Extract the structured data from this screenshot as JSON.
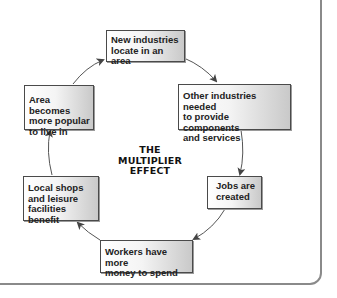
{
  "diagram": {
    "title_lines": [
      "THE",
      "MULTIPLIER",
      "EFFECT"
    ],
    "type": "cycle",
    "nodes": [
      {
        "id": "n1",
        "label": "New industries locate in an area",
        "lines": [
          "New industries",
          "locate in an area"
        ]
      },
      {
        "id": "n2",
        "label": "Other industries needed to provide components and services",
        "lines": [
          "Other industries needed",
          "to provide components",
          "and services"
        ]
      },
      {
        "id": "n3",
        "label": "Jobs are created",
        "lines": [
          "Jobs are",
          "created"
        ]
      },
      {
        "id": "n4",
        "label": "Workers have more money to spend",
        "lines": [
          "Workers have more",
          "money to spend"
        ]
      },
      {
        "id": "n5",
        "label": "Local shops and leisure facilities benefit",
        "lines": [
          "Local shops",
          "and leisure",
          "facilities benefit"
        ]
      },
      {
        "id": "n6",
        "label": "Area becomes more popular to live in",
        "lines": [
          "Area becomes",
          "more popular",
          "to live in"
        ]
      }
    ],
    "edges": [
      {
        "from": "n1",
        "to": "n2"
      },
      {
        "from": "n2",
        "to": "n3"
      },
      {
        "from": "n3",
        "to": "n4"
      },
      {
        "from": "n4",
        "to": "n5"
      },
      {
        "from": "n5",
        "to": "n6"
      },
      {
        "from": "n6",
        "to": "n1"
      }
    ],
    "colors": {
      "border": "#4a4a4a",
      "arrow": "#444444",
      "frame": "#8a8a8a",
      "box_light": "#ffffff",
      "box_dark": "#c9c9c9"
    }
  }
}
